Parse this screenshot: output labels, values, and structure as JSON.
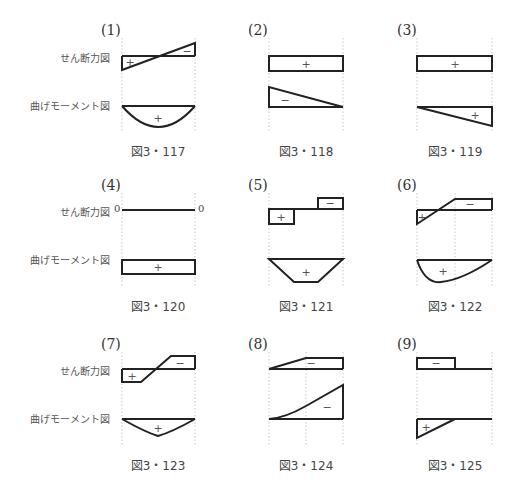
{
  "row_labels": {
    "shear": "せん断力図",
    "moment": "曲げモーメント図"
  },
  "panels": [
    {
      "number": "(1)",
      "caption": "図3・117",
      "shear_signs": [
        "+",
        "−"
      ],
      "moment_signs": [
        "+"
      ]
    },
    {
      "number": "(2)",
      "caption": "図3・118",
      "shear_signs": [
        "+"
      ],
      "moment_signs": [
        "−"
      ]
    },
    {
      "number": "(3)",
      "caption": "図3・119",
      "shear_signs": [
        "+"
      ],
      "moment_signs": [
        "+"
      ]
    },
    {
      "number": "(4)",
      "caption": "図3・120",
      "shear_signs": [],
      "shear_end_labels": [
        "0",
        "0"
      ],
      "moment_signs": [
        "+"
      ]
    },
    {
      "number": "(5)",
      "caption": "図3・121",
      "shear_signs": [
        "+",
        "−"
      ],
      "moment_signs": [
        "+"
      ]
    },
    {
      "number": "(6)",
      "caption": "図3・122",
      "shear_signs": [
        "+",
        "−"
      ],
      "moment_signs": [
        "+"
      ]
    },
    {
      "number": "(7)",
      "caption": "図3・123",
      "shear_signs": [
        "+",
        "−"
      ],
      "moment_signs": [
        "+"
      ]
    },
    {
      "number": "(8)",
      "caption": "図3・124",
      "shear_signs": [
        "−"
      ],
      "moment_signs": [
        "−"
      ]
    },
    {
      "number": "(9)",
      "caption": "図3・125",
      "shear_signs": [
        "−"
      ],
      "moment_signs": [
        "+"
      ]
    }
  ],
  "colors": {
    "line": "#222222",
    "guide": "#bbbbbb",
    "text": "#444444"
  }
}
